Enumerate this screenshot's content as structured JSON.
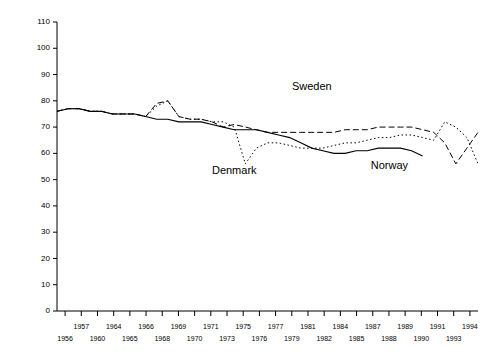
{
  "chart_data": {
    "type": "line",
    "title": "",
    "xlabel": "",
    "ylabel": "",
    "ylim": [
      0,
      110
    ],
    "xlim": [
      1956,
      1994
    ],
    "grid": false,
    "legend": "inline-annotations",
    "ytick_labels": [
      "0",
      "10",
      "20",
      "30",
      "40",
      "50",
      "60",
      "70",
      "80",
      "90",
      "100",
      "110"
    ],
    "ytick_values": [
      0,
      10,
      20,
      30,
      40,
      50,
      60,
      70,
      80,
      90,
      100,
      110
    ],
    "xtick_labels_upper": [
      "1957",
      "1964",
      "1966",
      "1969",
      "1971",
      "1975",
      "1977",
      "1981",
      "1984",
      "1987",
      "1989",
      "1991",
      "1994"
    ],
    "xtick_labels_lower": [
      "1956",
      "1960",
      "1965",
      "1968",
      "1970",
      "1973",
      "1976",
      "1979",
      "1982",
      "1985",
      "1988",
      "1990",
      "1993"
    ],
    "x": [
      1956,
      1957,
      1958,
      1959,
      1960,
      1961,
      1962,
      1963,
      1964,
      1965,
      1966,
      1967,
      1968,
      1969,
      1970,
      1971,
      1972,
      1973,
      1974,
      1975,
      1976,
      1977,
      1978,
      1979,
      1980,
      1981,
      1982,
      1983,
      1984,
      1985,
      1986,
      1987,
      1988,
      1989,
      1990,
      1991,
      1992,
      1993,
      1994
    ],
    "series": [
      {
        "name": "Sweden",
        "style": "dashed",
        "label_x": 1979,
        "label_y": 84,
        "values": [
          76,
          77,
          77,
          76,
          76,
          75,
          75,
          75,
          74,
          79,
          80,
          74,
          73,
          73,
          72,
          70,
          71,
          70,
          69,
          68,
          68,
          68,
          68,
          68,
          68,
          68,
          69,
          69,
          69,
          70,
          70,
          70,
          70,
          69,
          68,
          64,
          56,
          62,
          68
        ]
      },
      {
        "name": "Denmark",
        "style": "dotted",
        "label_x": 1972,
        "label_y": 52,
        "values": [
          76,
          77,
          77,
          76,
          76,
          75,
          75,
          75,
          74,
          78,
          80,
          74,
          73,
          73,
          72,
          72,
          70,
          56,
          62,
          64,
          64,
          63,
          62,
          62,
          62,
          63,
          64,
          64,
          65,
          66,
          66,
          67,
          67,
          66,
          65,
          72,
          70,
          66,
          56
        ]
      },
      {
        "name": "Norway",
        "style": "solid",
        "label_x": 1986,
        "label_y": 54,
        "values": [
          76,
          77,
          77,
          76,
          76,
          75,
          75,
          75,
          74,
          73,
          73,
          72,
          72,
          72,
          71,
          70,
          69,
          69,
          69,
          68,
          67,
          66,
          64,
          62,
          61,
          60,
          60,
          61,
          61,
          62,
          62,
          62,
          61,
          59,
          null,
          null,
          null,
          null,
          null
        ]
      }
    ]
  }
}
